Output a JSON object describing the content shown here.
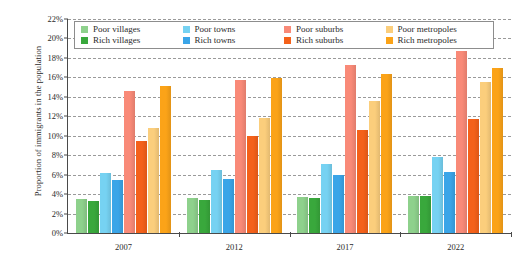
{
  "chart_data": {
    "type": "bar",
    "title": "",
    "xlabel": "",
    "ylabel": "Proportion of immigrants in the population",
    "categories": [
      "2007",
      "2012",
      "2017",
      "2022"
    ],
    "ylim": [
      0,
      22
    ],
    "ytick_step": 2,
    "ytick_labels": [
      "0%",
      "2%",
      "4%",
      "6%",
      "8%",
      "10%",
      "12%",
      "14%",
      "16%",
      "18%",
      "20%",
      "22%"
    ],
    "ytick_values": [
      0,
      2,
      4,
      6,
      8,
      10,
      12,
      14,
      16,
      18,
      20,
      22
    ],
    "grid": true,
    "grid_style": "dashed-horizontal",
    "legend_position": "top-inside",
    "value_unit": "%",
    "series": [
      {
        "name": "Poor villages",
        "color": "#8ed18c",
        "values": [
          3.5,
          3.6,
          3.7,
          3.85
        ]
      },
      {
        "name": "Rich villages",
        "color": "#39a83c",
        "values": [
          3.3,
          3.4,
          3.6,
          3.8
        ]
      },
      {
        "name": "Poor towns",
        "color": "#76d2f2",
        "values": [
          6.2,
          6.5,
          7.1,
          7.8
        ]
      },
      {
        "name": "Rich towns",
        "color": "#3aa5e8",
        "values": [
          5.4,
          5.6,
          5.95,
          6.3
        ]
      },
      {
        "name": "Poor suburbs",
        "color": "#f98a78",
        "values": [
          14.6,
          15.7,
          17.3,
          18.7
        ]
      },
      {
        "name": "Rich suburbs",
        "color": "#f4611a",
        "values": [
          9.5,
          10.0,
          10.6,
          11.7
        ]
      },
      {
        "name": "Poor metropoles",
        "color": "#fbce7c",
        "values": [
          10.8,
          11.8,
          13.6,
          15.5
        ]
      },
      {
        "name": "Rich metropoles",
        "color": "#fba318",
        "values": [
          15.1,
          15.9,
          16.3,
          17.0
        ]
      }
    ]
  },
  "legend": {
    "items": [
      {
        "label": "Poor villages"
      },
      {
        "label": "Rich villages"
      },
      {
        "label": "Poor towns"
      },
      {
        "label": "Rich towns"
      },
      {
        "label": "Poor suburbs"
      },
      {
        "label": "Rich suburbs"
      },
      {
        "label": "Poor metropoles"
      },
      {
        "label": "Rich metropoles"
      }
    ]
  },
  "axes": {
    "y_title": "Proportion of immigrants in the population"
  }
}
